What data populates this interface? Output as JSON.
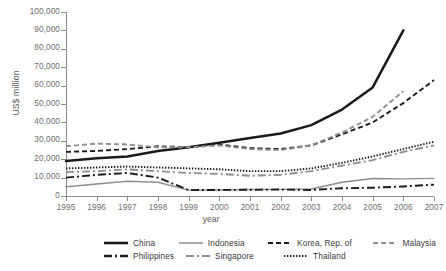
{
  "axes": {
    "ylabel": "US$ million",
    "xlabel": "year",
    "yticks": [
      "0",
      "10,000",
      "20,000",
      "30,000",
      "40,000",
      "50,000",
      "60,000",
      "70,000",
      "80,000",
      "90,000",
      "100,000"
    ],
    "xticks": [
      "1995",
      "1996",
      "1997",
      "1998",
      "1999",
      "2000",
      "2001",
      "2002",
      "2003",
      "2004",
      "2005",
      "2006",
      "2007"
    ]
  },
  "legend": {
    "china": "China",
    "indonesia": "Indonesia",
    "korea": "Korea, Rep. of",
    "malaysia": "Malaysia",
    "philippines": "Philippines",
    "singapore": "Singapore",
    "thailand": "Thailand"
  },
  "colors": {
    "dark": "#1a1a1a",
    "gray": "#8e8e90",
    "axis": "#8c8c8e",
    "text": "#6d6d70"
  },
  "chart_data": {
    "type": "line",
    "title": "",
    "xlabel": "year",
    "ylabel": "US$ million",
    "x": [
      1995,
      1996,
      1997,
      1998,
      1999,
      2000,
      2001,
      2002,
      2003,
      2004,
      2005,
      2006,
      2007
    ],
    "ylim": [
      0,
      100000
    ],
    "xlim": [
      1995,
      2007
    ],
    "ytick_step": 10000,
    "grid": false,
    "legend_position": "bottom",
    "series": [
      {
        "name": "China",
        "style": "solid",
        "width": "thick",
        "color": "#1a1a1a",
        "values": [
          19000,
          20500,
          21500,
          24500,
          26500,
          29000,
          31500,
          34000,
          38500,
          47000,
          59000,
          90000,
          null
        ]
      },
      {
        "name": "Indonesia",
        "style": "solid",
        "width": "thin",
        "color": "#8e8e90",
        "values": [
          5000,
          6500,
          8000,
          7500,
          3200,
          3300,
          3500,
          3600,
          3800,
          7500,
          9500,
          9300,
          9600
        ]
      },
      {
        "name": "Korea, Rep. of",
        "style": "dashed",
        "width": "medium",
        "color": "#1a1a1a",
        "values": [
          24000,
          24500,
          25500,
          27000,
          26500,
          28000,
          26000,
          25500,
          27500,
          33500,
          40000,
          50500,
          63000
        ]
      },
      {
        "name": "Malaysia",
        "style": "dashed",
        "width": "medium",
        "color": "#8e8e90",
        "values": [
          27000,
          28500,
          28000,
          26500,
          26500,
          27500,
          25500,
          25000,
          27500,
          34500,
          43000,
          57000,
          null
        ]
      },
      {
        "name": "Philippines",
        "style": "dashdot",
        "width": "medium",
        "color": "#1a1a1a",
        "values": [
          10000,
          11500,
          12500,
          10000,
          3200,
          3300,
          3400,
          3500,
          3300,
          4200,
          4500,
          5200,
          6200
        ]
      },
      {
        "name": "Singapore",
        "style": "dashdot",
        "width": "medium",
        "color": "#8e8e90",
        "values": [
          13000,
          13500,
          14500,
          13500,
          12500,
          12000,
          11000,
          11500,
          13500,
          16500,
          19500,
          24000,
          27500
        ]
      },
      {
        "name": "Thailand",
        "style": "dotted",
        "width": "medium",
        "color": "#1a1a1a",
        "values": [
          15000,
          15500,
          16000,
          15500,
          15000,
          14500,
          13500,
          13500,
          15000,
          18000,
          21500,
          25500,
          29500
        ]
      }
    ]
  }
}
